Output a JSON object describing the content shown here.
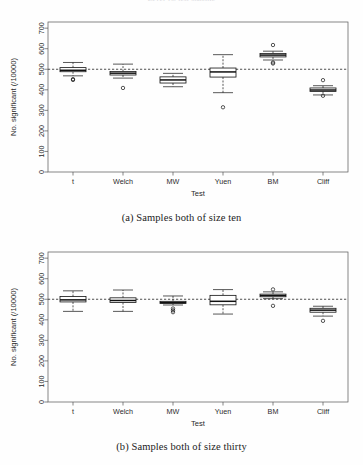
{
  "figure": {
    "clipped_top_title": "Level vs. test statistic",
    "caption_a": "(a) Samples both of size ten",
    "caption_b": "(b) Samples both of size thirty"
  },
  "chart_data": [
    {
      "type": "box",
      "id": "panel-a",
      "title": "",
      "xlabel": "Test",
      "ylabel": "No. significant (/10000)",
      "categories": [
        "t",
        "Welch",
        "MW",
        "Yuen",
        "BM",
        "Cliff"
      ],
      "ylim": [
        0,
        730
      ],
      "yticks": [
        0,
        100,
        200,
        300,
        400,
        500,
        600,
        700
      ],
      "ytick_labels": [
        "0",
        "100",
        "200",
        "300",
        "400",
        "500",
        "600",
        "700"
      ],
      "grid": false,
      "reference_line": 500,
      "boxes": [
        {
          "category": "t",
          "whisker_low": 468,
          "q1": 488,
          "median": 495,
          "q3": 508,
          "whisker_high": 533,
          "outliers": [
            452,
            448
          ]
        },
        {
          "category": "Welch",
          "whisker_low": 457,
          "q1": 472,
          "median": 481,
          "q3": 489,
          "whisker_high": 525,
          "outliers": [
            409
          ]
        },
        {
          "category": "MW",
          "whisker_low": 415,
          "q1": 433,
          "median": 448,
          "q3": 463,
          "whisker_high": 480,
          "outliers": []
        },
        {
          "category": "Yuen",
          "whisker_low": 386,
          "q1": 462,
          "median": 487,
          "q3": 506,
          "whisker_high": 571,
          "outliers": [
            315
          ]
        },
        {
          "category": "BM",
          "whisker_low": 545,
          "q1": 560,
          "median": 569,
          "q3": 577,
          "whisker_high": 588,
          "outliers": [
            618,
            533,
            528
          ]
        },
        {
          "category": "Cliff",
          "whisker_low": 375,
          "q1": 392,
          "median": 399,
          "q3": 409,
          "whisker_high": 420,
          "outliers": [
            447,
            371
          ]
        }
      ]
    },
    {
      "type": "box",
      "id": "panel-b",
      "title": "",
      "xlabel": "Test",
      "ylabel": "No. significant (/10000)",
      "categories": [
        "t",
        "Welch",
        "MW",
        "Yuen",
        "BM",
        "Cliff"
      ],
      "ylim": [
        0,
        730
      ],
      "yticks": [
        0,
        100,
        200,
        300,
        400,
        500,
        600,
        700
      ],
      "ytick_labels": [
        "0",
        "100",
        "200",
        "300",
        "400",
        "500",
        "600",
        "700"
      ],
      "grid": false,
      "reference_line": 500,
      "boxes": [
        {
          "category": "t",
          "whisker_low": 441,
          "q1": 487,
          "median": 497,
          "q3": 513,
          "whisker_high": 541,
          "outliers": []
        },
        {
          "category": "Welch",
          "whisker_low": 441,
          "q1": 484,
          "median": 494,
          "q3": 507,
          "whisker_high": 545,
          "outliers": []
        },
        {
          "category": "MW",
          "whisker_low": 472,
          "q1": 479,
          "median": 484,
          "q3": 490,
          "whisker_high": 516,
          "outliers": [
            455,
            446,
            437
          ]
        },
        {
          "category": "Yuen",
          "whisker_low": 428,
          "q1": 473,
          "median": 490,
          "q3": 519,
          "whisker_high": 547,
          "outliers": []
        },
        {
          "category": "BM",
          "whisker_low": 503,
          "q1": 512,
          "median": 518,
          "q3": 525,
          "whisker_high": 536,
          "outliers": [
            548,
            468
          ]
        },
        {
          "category": "Cliff",
          "whisker_low": 418,
          "q1": 437,
          "median": 447,
          "q3": 456,
          "whisker_high": 466,
          "outliers": [
            395
          ]
        }
      ]
    }
  ]
}
